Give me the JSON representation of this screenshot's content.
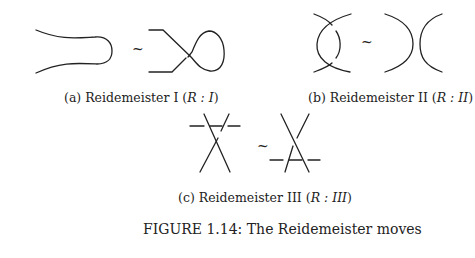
{
  "subfigures": [
    {
      "id": "a",
      "caption_prefix": "(a) Reidemeister I (",
      "caption_math": "R : I",
      "caption_suffix": ")",
      "equiv_symbol": "~"
    },
    {
      "id": "b",
      "caption_prefix": "(b) Reidemeister II (",
      "caption_math": "R : II",
      "caption_suffix": ")",
      "equiv_symbol": "~"
    },
    {
      "id": "c",
      "caption_prefix": "(c) Reidemeister III (",
      "caption_math": "R : III",
      "caption_suffix": ")",
      "equiv_symbol": "~"
    }
  ],
  "figure_caption": "FIGURE 1.14: The Reidemeister moves",
  "colors": {
    "stroke": "#222222",
    "background": "#ffffff"
  }
}
